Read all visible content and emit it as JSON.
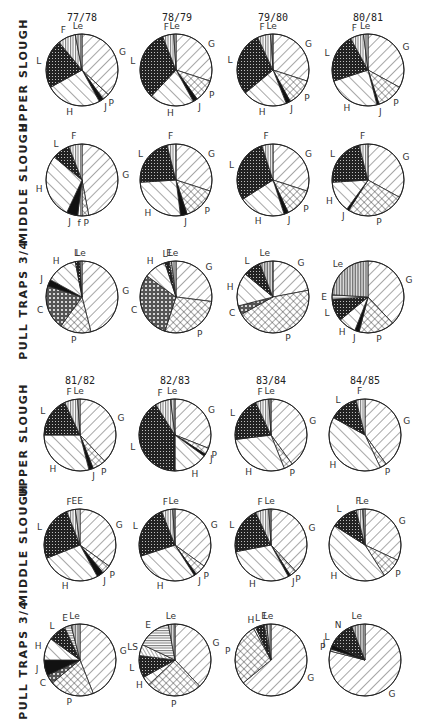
{
  "figure": {
    "block1_years": [
      "77/78",
      "78/79",
      "79/80",
      "80/81"
    ],
    "block2_years": [
      "81/82",
      "82/83",
      "83/84",
      "84/85"
    ],
    "rows": [
      "UPPER SLOUGH",
      "MIDDLE SLOUGH",
      "PULL TRAPS 3/4"
    ]
  },
  "patterns": {
    "G": "diag-light",
    "P": "crosshatch",
    "J": "solid",
    "H": "diag-wide",
    "L": "dots-dark",
    "F": "vertical",
    "Le": "vertical-fine",
    "E": "horizontal",
    "C": "crosshatch-dark",
    "LS": "diag-back",
    "N": "dots-dark",
    "f": "vertical",
    "EE": "vertical"
  },
  "chart_data": [
    {
      "type": "pie",
      "title": "77/78",
      "row": "UPPER SLOUGH",
      "slices": [
        {
          "label": "G",
          "value": 37
        },
        {
          "label": "P",
          "value": 3
        },
        {
          "label": "J",
          "value": 2
        },
        {
          "label": "H",
          "value": 25
        },
        {
          "label": "L",
          "value": 22
        },
        {
          "label": "F",
          "value": 8
        },
        {
          "label": "Le",
          "value": 3
        }
      ]
    },
    {
      "type": "pie",
      "title": "78/79",
      "row": "UPPER SLOUGH",
      "slices": [
        {
          "label": "G",
          "value": 30
        },
        {
          "label": "P",
          "value": 10
        },
        {
          "label": "J",
          "value": 2
        },
        {
          "label": "H",
          "value": 20
        },
        {
          "label": "L",
          "value": 32
        },
        {
          "label": "F",
          "value": 5
        },
        {
          "label": "Le",
          "value": 1
        }
      ]
    },
    {
      "type": "pie",
      "title": "79/80",
      "row": "UPPER SLOUGH",
      "slices": [
        {
          "label": "G",
          "value": 30
        },
        {
          "label": "P",
          "value": 12
        },
        {
          "label": "J",
          "value": 2
        },
        {
          "label": "H",
          "value": 20
        },
        {
          "label": "L",
          "value": 29
        },
        {
          "label": "F",
          "value": 6
        },
        {
          "label": "Le",
          "value": 1
        }
      ]
    },
    {
      "type": "pie",
      "title": "80/81",
      "row": "UPPER SLOUGH",
      "slices": [
        {
          "label": "G",
          "value": 33
        },
        {
          "label": "P",
          "value": 12
        },
        {
          "label": "J",
          "value": 1
        },
        {
          "label": "H",
          "value": 24
        },
        {
          "label": "L",
          "value": 22
        },
        {
          "label": "F",
          "value": 6
        },
        {
          "label": "Le",
          "value": 2
        }
      ]
    },
    {
      "type": "pie",
      "title": "77/78",
      "row": "MIDDLE SLOUGH",
      "slices": [
        {
          "label": "G",
          "value": 47
        },
        {
          "label": "P",
          "value": 3
        },
        {
          "label": "f",
          "value": 2
        },
        {
          "label": "J",
          "value": 5
        },
        {
          "label": "H",
          "value": 29
        },
        {
          "label": "L",
          "value": 8
        },
        {
          "label": "F",
          "value": 6
        }
      ]
    },
    {
      "type": "pie",
      "title": "78/79",
      "row": "MIDDLE SLOUGH",
      "slices": [
        {
          "label": "G",
          "value": 30
        },
        {
          "label": "P",
          "value": 15
        },
        {
          "label": "J",
          "value": 3
        },
        {
          "label": "H",
          "value": 26
        },
        {
          "label": "L",
          "value": 22
        },
        {
          "label": "F",
          "value": 4
        }
      ]
    },
    {
      "type": "pie",
      "title": "79/80",
      "row": "MIDDLE SLOUGH",
      "slices": [
        {
          "label": "G",
          "value": 30
        },
        {
          "label": "P",
          "value": 13
        },
        {
          "label": "J",
          "value": 2
        },
        {
          "label": "H",
          "value": 21
        },
        {
          "label": "L",
          "value": 29
        },
        {
          "label": "F",
          "value": 5
        }
      ]
    },
    {
      "type": "pie",
      "title": "80/81",
      "row": "MIDDLE SLOUGH",
      "slices": [
        {
          "label": "G",
          "value": 33
        },
        {
          "label": "P",
          "value": 26
        },
        {
          "label": "J",
          "value": 1
        },
        {
          "label": "H",
          "value": 14
        },
        {
          "label": "L",
          "value": 22
        },
        {
          "label": "F",
          "value": 4
        }
      ]
    },
    {
      "type": "pie",
      "title": "77/78",
      "row": "PULL TRAPS 3/4",
      "slices": [
        {
          "label": "G",
          "value": 46
        },
        {
          "label": "P",
          "value": 14
        },
        {
          "label": "C",
          "value": 20
        },
        {
          "label": "J",
          "value": 3
        },
        {
          "label": "H",
          "value": 14
        },
        {
          "label": "L",
          "value": 2
        },
        {
          "label": "Le",
          "value": 1
        }
      ]
    },
    {
      "type": "pie",
      "title": "78/79",
      "row": "PULL TRAPS 3/4",
      "slices": [
        {
          "label": "G",
          "value": 27
        },
        {
          "label": "P",
          "value": 28
        },
        {
          "label": "C",
          "value": 30
        },
        {
          "label": "H",
          "value": 10
        },
        {
          "label": "L",
          "value": 2
        },
        {
          "label": "E",
          "value": 1
        },
        {
          "label": "Le",
          "value": 2
        }
      ]
    },
    {
      "type": "pie",
      "title": "79/80",
      "row": "PULL TRAPS 3/4",
      "slices": [
        {
          "label": "G",
          "value": 22
        },
        {
          "label": "P",
          "value": 45
        },
        {
          "label": "C",
          "value": 4
        },
        {
          "label": "H",
          "value": 15
        },
        {
          "label": "L",
          "value": 8
        },
        {
          "label": "Le",
          "value": 6
        }
      ]
    },
    {
      "type": "pie",
      "title": "80/81",
      "row": "PULL TRAPS 3/4",
      "slices": [
        {
          "label": "G",
          "value": 38
        },
        {
          "label": "P",
          "value": 16
        },
        {
          "label": "J",
          "value": 2
        },
        {
          "label": "H",
          "value": 8
        },
        {
          "label": "L",
          "value": 10
        },
        {
          "label": "E",
          "value": 2
        },
        {
          "label": "Le",
          "value": 24
        }
      ]
    },
    {
      "type": "pie",
      "title": "81/82",
      "row": "UPPER SLOUGH",
      "slices": [
        {
          "label": "G",
          "value": 38
        },
        {
          "label": "P",
          "value": 6
        },
        {
          "label": "J",
          "value": 2
        },
        {
          "label": "H",
          "value": 29
        },
        {
          "label": "L",
          "value": 18
        },
        {
          "label": "F",
          "value": 6
        },
        {
          "label": "Le",
          "value": 1
        }
      ]
    },
    {
      "type": "pie",
      "title": "82/83",
      "row": "UPPER SLOUGH",
      "slices": [
        {
          "label": "G",
          "value": 31
        },
        {
          "label": "P",
          "value": 3
        },
        {
          "label": "J",
          "value": 1
        },
        {
          "label": "H",
          "value": 15
        },
        {
          "label": "L",
          "value": 41
        },
        {
          "label": "F",
          "value": 7
        },
        {
          "label": "Le",
          "value": 2
        }
      ]
    },
    {
      "type": "pie",
      "title": "83/84",
      "row": "UPPER SLOUGH",
      "slices": [
        {
          "label": "G",
          "value": 40
        },
        {
          "label": "P",
          "value": 4
        },
        {
          "label": "H",
          "value": 29
        },
        {
          "label": "L",
          "value": 20
        },
        {
          "label": "F",
          "value": 6
        },
        {
          "label": "Le",
          "value": 1
        }
      ]
    },
    {
      "type": "pie",
      "title": "84/85",
      "row": "UPPER SLOUGH",
      "slices": [
        {
          "label": "G",
          "value": 40
        },
        {
          "label": "P",
          "value": 3
        },
        {
          "label": "H",
          "value": 40
        },
        {
          "label": "L",
          "value": 13
        },
        {
          "label": "F",
          "value": 4
        }
      ]
    },
    {
      "type": "pie",
      "title": "81/82",
      "row": "MIDDLE SLOUGH",
      "slices": [
        {
          "label": "G",
          "value": 35
        },
        {
          "label": "P",
          "value": 4
        },
        {
          "label": "J",
          "value": 3
        },
        {
          "label": "H",
          "value": 27
        },
        {
          "label": "L",
          "value": 25
        },
        {
          "label": "F",
          "value": 4
        },
        {
          "label": "EE",
          "value": 2
        }
      ]
    },
    {
      "type": "pie",
      "title": "82/83",
      "row": "MIDDLE SLOUGH",
      "slices": [
        {
          "label": "G",
          "value": 35
        },
        {
          "label": "P",
          "value": 5
        },
        {
          "label": "J",
          "value": 1
        },
        {
          "label": "H",
          "value": 29
        },
        {
          "label": "L",
          "value": 24
        },
        {
          "label": "F",
          "value": 5
        },
        {
          "label": "Le",
          "value": 1
        }
      ]
    },
    {
      "type": "pie",
      "title": "83/84",
      "row": "MIDDLE SLOUGH",
      "slices": [
        {
          "label": "G",
          "value": 38
        },
        {
          "label": "P",
          "value": 3
        },
        {
          "label": "J",
          "value": 1
        },
        {
          "label": "H",
          "value": 30
        },
        {
          "label": "L",
          "value": 21
        },
        {
          "label": "F",
          "value": 6
        },
        {
          "label": "Le",
          "value": 1
        }
      ]
    },
    {
      "type": "pie",
      "title": "84/85",
      "row": "MIDDLE SLOUGH",
      "slices": [
        {
          "label": "G",
          "value": 32
        },
        {
          "label": "P",
          "value": 9
        },
        {
          "label": "H",
          "value": 43
        },
        {
          "label": "L",
          "value": 12
        },
        {
          "label": "F",
          "value": 3
        },
        {
          "label": "Le",
          "value": 1
        }
      ]
    },
    {
      "type": "pie",
      "title": "81/82",
      "row": "PULL TRAPS 3/4",
      "slices": [
        {
          "label": "G",
          "value": 44
        },
        {
          "label": "P",
          "value": 20
        },
        {
          "label": "C",
          "value": 4
        },
        {
          "label": "J",
          "value": 7
        },
        {
          "label": "H",
          "value": 10
        },
        {
          "label": "L",
          "value": 8
        },
        {
          "label": "E",
          "value": 3
        },
        {
          "label": "Le",
          "value": 4
        }
      ]
    },
    {
      "type": "pie",
      "title": "82/83",
      "row": "PULL TRAPS 3/4",
      "slices": [
        {
          "label": "G",
          "value": 38
        },
        {
          "label": "P",
          "value": 25
        },
        {
          "label": "H",
          "value": 4
        },
        {
          "label": "L",
          "value": 10
        },
        {
          "label": "LS",
          "value": 5
        },
        {
          "label": "E",
          "value": 15
        },
        {
          "label": "Le",
          "value": 3
        }
      ]
    },
    {
      "type": "pie",
      "title": "83/84",
      "row": "PULL TRAPS 3/4",
      "slices": [
        {
          "label": "G",
          "value": 64
        },
        {
          "label": "P",
          "value": 28
        },
        {
          "label": "H",
          "value": 1
        },
        {
          "label": "L",
          "value": 4
        },
        {
          "label": "E",
          "value": 1
        },
        {
          "label": "Le",
          "value": 2
        }
      ]
    },
    {
      "type": "pie",
      "title": "84/85",
      "row": "PULL TRAPS 3/4",
      "slices": [
        {
          "label": "G",
          "value": 79
        },
        {
          "label": "P",
          "value": 1
        },
        {
          "label": "J",
          "value": 2
        },
        {
          "label": "L",
          "value": 3
        },
        {
          "label": "N",
          "value": 9
        },
        {
          "label": "Le",
          "value": 6
        }
      ]
    }
  ]
}
